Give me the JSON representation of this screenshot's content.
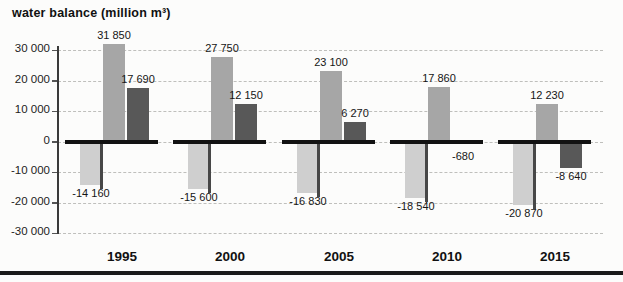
{
  "title": "water balance (million m³)",
  "chart_data": {
    "type": "bar",
    "title": "water balance (million m³)",
    "ylabel": "water balance (million m³)",
    "xlabel": "year",
    "categories": [
      "1995",
      "2000",
      "2005",
      "2010",
      "2015"
    ],
    "series": [
      {
        "name": "light-gray-bar",
        "color": "#cfcfcf",
        "values": [
          -14160,
          -15600,
          -16830,
          -18540,
          -20870
        ],
        "labels": [
          "-14 160",
          "-15 600",
          "-16 830",
          "-18 540",
          "-20 870"
        ]
      },
      {
        "name": "medium-gray-bar",
        "color": "#a6a6a6",
        "values": [
          31850,
          27750,
          23100,
          17860,
          12230
        ],
        "labels": [
          "31 850",
          "27 750",
          "23 100",
          "17 860",
          "12 230"
        ]
      },
      {
        "name": "dark-gray-bar",
        "color": "#585858",
        "values": [
          17690,
          12150,
          6270,
          -680,
          -8640
        ],
        "labels": [
          "17 690",
          "12 150",
          "6 270",
          "-680",
          "-8 640"
        ]
      }
    ],
    "ylim": [
      -30000,
      30000
    ],
    "yticks": [
      30000,
      20000,
      10000,
      0,
      -10000,
      -20000,
      -30000
    ],
    "ytick_labels": [
      "30 000",
      "20 000",
      "10 000",
      "0",
      "-10 000",
      "-20 000",
      "-30 000"
    ],
    "grid": "horizontal-dashed",
    "legend": "none"
  }
}
